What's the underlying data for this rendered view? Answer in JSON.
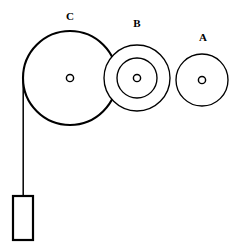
{
  "diagram": {
    "canvas": {
      "width": 237,
      "height": 251,
      "background": "#ffffff"
    },
    "stroke_color": "#000000",
    "fill_color": "#ffffff",
    "pulleys": [
      {
        "id": "C",
        "label": "C",
        "cx": 70,
        "cy": 78,
        "radius": 47,
        "inner_radius": null,
        "hub_radius": 3.6,
        "stroke_width": 2.1,
        "label_x": 70,
        "label_y": 17
      },
      {
        "id": "B",
        "label": "B",
        "cx": 137,
        "cy": 78,
        "radius": 33,
        "inner_radius": 20,
        "hub_radius": 3.6,
        "stroke_width": 1.35,
        "label_x": 137,
        "label_y": 24
      },
      {
        "id": "A",
        "label": "A",
        "cx": 202,
        "cy": 80,
        "radius": 26,
        "inner_radius": null,
        "hub_radius": 3.6,
        "stroke_width": 1.35,
        "label_x": 203,
        "label_y": 38
      }
    ],
    "rope": {
      "name": "rope",
      "x1": 23.2,
      "y1": 78,
      "x2": 23.2,
      "y2": 197
    },
    "weight": {
      "name": "hanging-weight",
      "x": 13,
      "y": 196,
      "width": 20,
      "height": 44
    }
  }
}
